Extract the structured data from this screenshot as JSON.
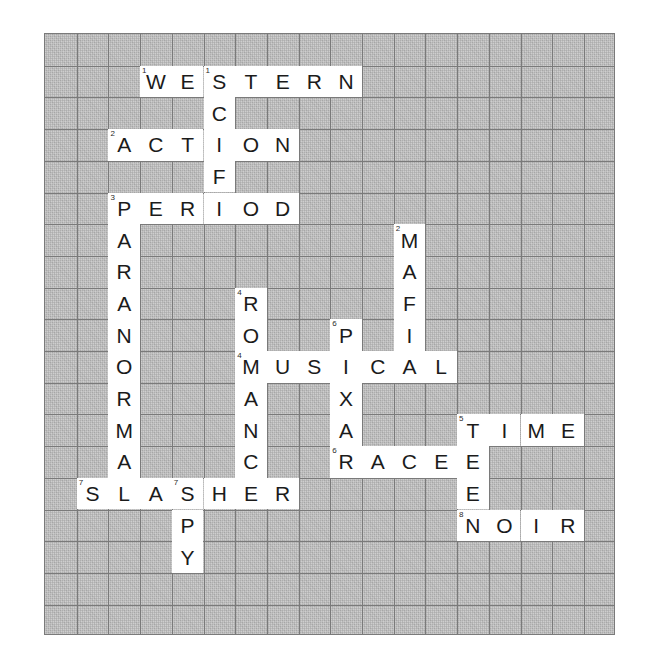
{
  "puzzle": {
    "title": "Film Genre Crossword Grid",
    "columns": 18,
    "rows": 19,
    "cell_size": 31.7,
    "origin": {
      "x": 44,
      "y": 33
    },
    "colors": {
      "block_fill": "#bdbdbd",
      "cell_fill": "#ffffff",
      "grid_line": "#7a7a7a",
      "letter": "#1b1b1b",
      "clue_number": "#2a2a2a",
      "page_background": "#ffffff"
    },
    "entries": [
      {
        "number": 1,
        "direction": "across",
        "answer": "WESTERN",
        "row": 1,
        "col": 3,
        "length": 7
      },
      {
        "number": 1,
        "direction": "down",
        "answer": "SCIF",
        "row": 1,
        "col": 5,
        "length": 4
      },
      {
        "number": 2,
        "direction": "across",
        "answer": "ACTION",
        "row": 3,
        "col": 2,
        "length": 6
      },
      {
        "number": 2,
        "direction": "down",
        "answer": "MAFIA",
        "row": 6,
        "col": 11,
        "length": 5
      },
      {
        "number": 3,
        "direction": "across",
        "answer": "PERIOD",
        "row": 5,
        "col": 2,
        "length": 6
      },
      {
        "number": 3,
        "direction": "down",
        "answer": "PARANORMAL",
        "row": 5,
        "col": 2,
        "length": 10
      },
      {
        "number": 4,
        "direction": "across",
        "answer": "MUSICAL",
        "row": 11,
        "col": 6,
        "length": 7
      },
      {
        "number": 4,
        "direction": "down",
        "answer": "ROMANCE",
        "row": 8,
        "col": 6,
        "length": 7
      },
      {
        "number": 5,
        "direction": "across",
        "answer": "TIME",
        "row": 13,
        "col": 13,
        "length": 4
      },
      {
        "number": 5,
        "direction": "down",
        "answer": "TEEN",
        "row": 13,
        "col": 13,
        "length": 4
      },
      {
        "number": 6,
        "direction": "across",
        "answer": "RACE",
        "row": 14,
        "col": 9,
        "length": 4
      },
      {
        "number": 6,
        "direction": "down",
        "answer": "PIXAR",
        "row": 10,
        "col": 9,
        "length": 5
      },
      {
        "number": 7,
        "direction": "across",
        "answer": "SLASHER",
        "row": 15,
        "col": 1,
        "length": 7
      },
      {
        "number": 7,
        "direction": "down",
        "answer": "SPY",
        "row": 15,
        "col": 4,
        "length": 3
      },
      {
        "number": 8,
        "direction": "across",
        "answer": "NOIR",
        "row": 17,
        "col": 13,
        "length": 4
      }
    ],
    "cells": [
      {
        "row": 1,
        "col": 3,
        "letter": "W",
        "number": 1
      },
      {
        "row": 1,
        "col": 4,
        "letter": "E"
      },
      {
        "row": 1,
        "col": 5,
        "letter": "S",
        "number": 1
      },
      {
        "row": 1,
        "col": 6,
        "letter": "T"
      },
      {
        "row": 1,
        "col": 7,
        "letter": "E"
      },
      {
        "row": 1,
        "col": 8,
        "letter": "R"
      },
      {
        "row": 1,
        "col": 9,
        "letter": "N"
      },
      {
        "row": 2,
        "col": 5,
        "letter": "C"
      },
      {
        "row": 3,
        "col": 2,
        "letter": "A",
        "number": 2
      },
      {
        "row": 3,
        "col": 3,
        "letter": "C"
      },
      {
        "row": 3,
        "col": 4,
        "letter": "T"
      },
      {
        "row": 3,
        "col": 5,
        "letter": "I"
      },
      {
        "row": 3,
        "col": 6,
        "letter": "O"
      },
      {
        "row": 3,
        "col": 7,
        "letter": "N"
      },
      {
        "row": 4,
        "col": 5,
        "letter": "F"
      },
      {
        "row": 5,
        "col": 2,
        "letter": "P",
        "number": 3
      },
      {
        "row": 5,
        "col": 3,
        "letter": "E"
      },
      {
        "row": 5,
        "col": 4,
        "letter": "R"
      },
      {
        "row": 5,
        "col": 5,
        "letter": "I"
      },
      {
        "row": 5,
        "col": 6,
        "letter": "O"
      },
      {
        "row": 5,
        "col": 7,
        "letter": "D"
      },
      {
        "row": 6,
        "col": 2,
        "letter": "A"
      },
      {
        "row": 6,
        "col": 11,
        "letter": "M",
        "number": 2
      },
      {
        "row": 7,
        "col": 2,
        "letter": "R"
      },
      {
        "row": 7,
        "col": 11,
        "letter": "A"
      },
      {
        "row": 8,
        "col": 2,
        "letter": "A"
      },
      {
        "row": 8,
        "col": 6,
        "letter": "R",
        "number": 4
      },
      {
        "row": 8,
        "col": 11,
        "letter": "F"
      },
      {
        "row": 9,
        "col": 2,
        "letter": "N"
      },
      {
        "row": 9,
        "col": 6,
        "letter": "O"
      },
      {
        "row": 9,
        "col": 9,
        "letter": "P",
        "number": 6
      },
      {
        "row": 9,
        "col": 11,
        "letter": "I"
      },
      {
        "row": 10,
        "col": 2,
        "letter": "O"
      },
      {
        "row": 10,
        "col": 6,
        "letter": "M",
        "number": 4
      },
      {
        "row": 10,
        "col": 7,
        "letter": "U"
      },
      {
        "row": 10,
        "col": 8,
        "letter": "S"
      },
      {
        "row": 10,
        "col": 9,
        "letter": "I"
      },
      {
        "row": 10,
        "col": 10,
        "letter": "C"
      },
      {
        "row": 10,
        "col": 11,
        "letter": "A"
      },
      {
        "row": 10,
        "col": 12,
        "letter": "L"
      },
      {
        "row": 11,
        "col": 2,
        "letter": "R"
      },
      {
        "row": 11,
        "col": 6,
        "letter": "A"
      },
      {
        "row": 11,
        "col": 9,
        "letter": "X"
      },
      {
        "row": 12,
        "col": 2,
        "letter": "M"
      },
      {
        "row": 12,
        "col": 6,
        "letter": "N"
      },
      {
        "row": 12,
        "col": 9,
        "letter": "A"
      },
      {
        "row": 12,
        "col": 13,
        "letter": "T",
        "number": 5
      },
      {
        "row": 12,
        "col": 14,
        "letter": "I"
      },
      {
        "row": 12,
        "col": 15,
        "letter": "M"
      },
      {
        "row": 12,
        "col": 16,
        "letter": "E"
      },
      {
        "row": 13,
        "col": 2,
        "letter": "A"
      },
      {
        "row": 13,
        "col": 6,
        "letter": "C"
      },
      {
        "row": 13,
        "col": 9,
        "letter": "R",
        "number": 6
      },
      {
        "row": 13,
        "col": 10,
        "letter": "A"
      },
      {
        "row": 13,
        "col": 11,
        "letter": "C"
      },
      {
        "row": 13,
        "col": 12,
        "letter": "E"
      },
      {
        "row": 13,
        "col": 13,
        "letter": "E"
      },
      {
        "row": 14,
        "col": 1,
        "letter": "S",
        "number": 7
      },
      {
        "row": 14,
        "col": 2,
        "letter": "L"
      },
      {
        "row": 14,
        "col": 3,
        "letter": "A"
      },
      {
        "row": 14,
        "col": 4,
        "letter": "S",
        "number": 7
      },
      {
        "row": 14,
        "col": 5,
        "letter": "H"
      },
      {
        "row": 14,
        "col": 6,
        "letter": "E"
      },
      {
        "row": 14,
        "col": 7,
        "letter": "R"
      },
      {
        "row": 14,
        "col": 13,
        "letter": "E"
      },
      {
        "row": 15,
        "col": 4,
        "letter": "P"
      },
      {
        "row": 15,
        "col": 13,
        "letter": "N",
        "number": 8
      },
      {
        "row": 15,
        "col": 14,
        "letter": "O"
      },
      {
        "row": 15,
        "col": 15,
        "letter": "I"
      },
      {
        "row": 15,
        "col": 16,
        "letter": "R"
      },
      {
        "row": 16,
        "col": 4,
        "letter": "Y"
      }
    ]
  }
}
